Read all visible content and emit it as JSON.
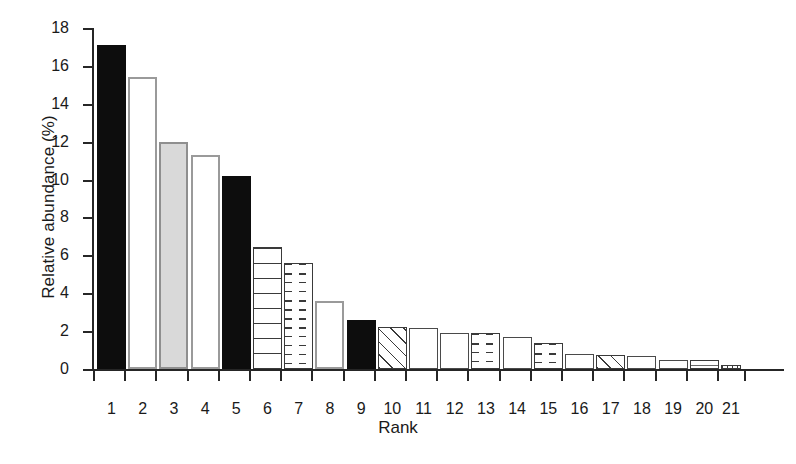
{
  "chart_data": {
    "type": "bar",
    "title": "",
    "xlabel": "Rank",
    "ylabel": "Relative abundance (%)",
    "ylim": [
      0,
      18
    ],
    "ytick_values": [
      0,
      2,
      4,
      6,
      8,
      10,
      12,
      14,
      16,
      18
    ],
    "ytick_labels": [
      "0",
      "2",
      "4",
      "6",
      "8",
      "10",
      "12",
      "14",
      "16",
      "18"
    ],
    "grid": false,
    "legend": "none",
    "categories": [
      "1",
      "2",
      "3",
      "4",
      "5",
      "6",
      "7",
      "8",
      "9",
      "10",
      "11",
      "12",
      "13",
      "14",
      "15",
      "16",
      "17",
      "18",
      "19",
      "20",
      "21"
    ],
    "values": [
      17.1,
      15.4,
      12.0,
      11.3,
      10.2,
      6.45,
      5.6,
      3.6,
      2.6,
      2.2,
      2.15,
      1.9,
      1.9,
      1.7,
      1.35,
      0.8,
      0.75,
      0.7,
      0.45,
      0.5,
      0.2
    ],
    "bar_styles": [
      "solid",
      "open-gray",
      "gray-fill",
      "open-gray",
      "solid",
      "lined-h",
      "dashed-h",
      "open-gray",
      "solid",
      "diag",
      "open-dark",
      "open-dark",
      "dashed-h",
      "open-dark",
      "dashed-h",
      "open-dark",
      "diag",
      "open-dark",
      "open-dark",
      "line-top",
      "lined-v"
    ],
    "bar_widths": [
      29,
      29,
      29,
      29,
      29,
      29,
      29,
      29,
      29,
      29,
      29,
      29,
      29,
      29,
      29,
      29,
      29,
      29,
      29,
      29,
      20
    ],
    "colors": {
      "axis": "#262626",
      "solid_fill": "#0d0d0d",
      "gray_fill": "#d9d9d9",
      "gray_border": "#9a9a9a",
      "dark_border": "#3a3a3a",
      "background": "#ffffff"
    }
  }
}
